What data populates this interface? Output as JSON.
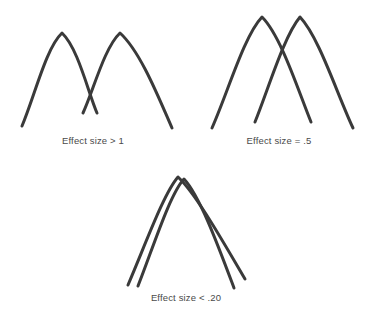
{
  "figure": {
    "title_visible": false,
    "background_color": "#ffffff",
    "stroke_color": "#3a3a3a",
    "label_color": "#4a4a4a",
    "panels": [
      {
        "id": "panel-effect-size-gt-1",
        "label": "Effect size > 1",
        "curve_count": 2,
        "overlap": "small"
      },
      {
        "id": "panel-effect-size-eq-point5",
        "label": "Effect size = .5",
        "curve_count": 2,
        "overlap": "moderate"
      },
      {
        "id": "panel-effect-size-lt-point20",
        "label": "Effect size < .20",
        "curve_count": 2,
        "overlap": "large"
      }
    ]
  },
  "chart_data": {
    "type": "line",
    "title": "",
    "subtitle": "",
    "xlabel": "",
    "ylabel": "",
    "grid": false,
    "legend": "none",
    "panels": [
      {
        "name": "Effect size > 1",
        "label": "Effect size > 1",
        "position": "top-left",
        "effect_size": "> 1",
        "curves": [
          {
            "name": "distribution-a",
            "peak": [
              62,
              33
            ],
            "left_tail_end": [
              22,
              126
            ],
            "right_tail_end": [
              97,
              113
            ],
            "path": "M22,126 C35,95 46,48 62,33 C78,48 88,92 97,113"
          },
          {
            "name": "distribution-b",
            "peak": [
              120,
              33
            ],
            "left_tail_end": [
              83,
              113
            ],
            "right_tail_end": [
              172,
              128
            ],
            "path": "M83,113 C93,92 104,48 120,33 C140,51 158,96 172,128"
          }
        ]
      },
      {
        "name": "Effect size = .5",
        "label": "Effect size = .5",
        "position": "top-right",
        "effect_size": "= .5",
        "curves": [
          {
            "name": "distribution-a",
            "peak": [
              262,
              17
            ],
            "left_tail_end": [
              212,
              128
            ],
            "right_tail_end": [
              311,
              122
            ],
            "path": "M212,128 C228,92 244,36 262,17 C281,36 298,90 311,122"
          },
          {
            "name": "distribution-b",
            "peak": [
              300,
              17
            ],
            "left_tail_end": [
              255,
              122
            ],
            "right_tail_end": [
              353,
              128
            ],
            "path": "M255,122 C268,90 284,36 300,17 C319,37 337,94 353,128"
          }
        ]
      },
      {
        "name": "Effect size < .20",
        "label": "Effect size < .20",
        "position": "bottom-center",
        "effect_size": "< .20",
        "curves": [
          {
            "name": "distribution-a",
            "peak": [
              178,
              177
            ],
            "left_tail_end": [
              128,
              285
            ],
            "right_tail_end": [
              245,
              279
            ],
            "path": "M128,285 C146,243 164,193 178,177 C196,194 222,240 245,279"
          },
          {
            "name": "distribution-b",
            "peak": [
              184,
              179
            ],
            "left_tail_end": [
              138,
              286
            ],
            "right_tail_end": [
              234,
              288
            ],
            "path": "M138,286 C154,245 170,194 184,179 C200,196 219,248 234,288"
          }
        ]
      }
    ]
  }
}
